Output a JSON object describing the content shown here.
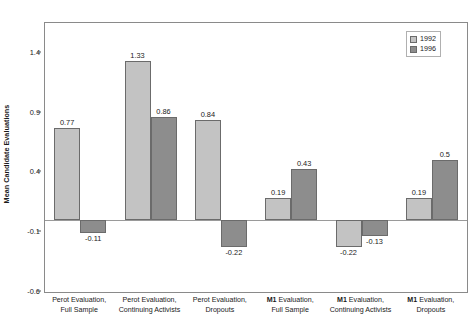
{
  "chart_data": {
    "type": "bar",
    "title": "",
    "xlabel": "",
    "ylabel": "Mean Candidate Evaluations",
    "ylim": [
      -0.6,
      1.65
    ],
    "yticks": [
      1.4,
      0.9,
      0.4,
      -0.1,
      -0.6
    ],
    "ytick_labels": [
      "1.4",
      "0.9",
      "0.4",
      "-0.1",
      "-0.6"
    ],
    "grid": false,
    "legend_position": "top-right",
    "categories": [
      "Perot Evaluation, Full Sample",
      "Perot Evaluation, Continuing Activists",
      "Perot Evaluation, Dropouts",
      "M1 Evaluation, Full Sample",
      "M1 Evaluation, Continuing Activists",
      "M1 Evaluation, Dropouts"
    ],
    "category_lines": [
      [
        "Perot Evaluation,",
        "Full Sample"
      ],
      [
        "Perot Evaluation,",
        "Continuing Activists"
      ],
      [
        "Perot Evaluation,",
        "Dropouts"
      ],
      [
        "M1 Evaluation,",
        "Full Sample"
      ],
      [
        "M1 Evaluation,",
        "Continuing Activists"
      ],
      [
        "M1 Evaluation,",
        "Dropouts"
      ]
    ],
    "series": [
      {
        "name": "1992",
        "color": "#c3c3c3",
        "values": [
          0.77,
          1.33,
          0.84,
          0.19,
          -0.22,
          0.19
        ],
        "labels": [
          "0.77",
          "1.33",
          "0.84",
          "0.19",
          "-0.22",
          "0.19"
        ]
      },
      {
        "name": "1996",
        "color": "#8d8d8d",
        "values": [
          -0.11,
          0.86,
          -0.22,
          0.43,
          -0.13,
          0.5
        ],
        "labels": [
          "-0.11",
          "0.86",
          "-0.22",
          "0.43",
          "-0.13",
          "0.5"
        ]
      }
    ]
  },
  "legend": {
    "items": [
      {
        "label": "1992"
      },
      {
        "label": "1996"
      }
    ]
  }
}
